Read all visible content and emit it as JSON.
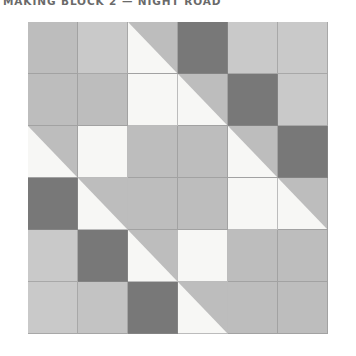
{
  "title": "MAKING BLOCK 2 — NIGHT ROAD",
  "palette": {
    "white": "#f7f7f5",
    "light": "#c9c9c9",
    "medium": "#bdbdbd",
    "medium_light": "#c3c3c3",
    "dark": "#787878",
    "seam": "#8c8c8c",
    "background": "#ffffff",
    "title_color": "#6a6a6a"
  },
  "block": {
    "name": "quilt-block-grid",
    "rows": 6,
    "cols": 6,
    "grid": [
      [
        {
          "name": "patch-r1c1",
          "type": "solid",
          "fill": "medium"
        },
        {
          "name": "patch-r1c2",
          "type": "solid",
          "fill": "light"
        },
        {
          "name": "patch-r1c3",
          "type": "hst",
          "orientation": "tl-br",
          "fill_a": "white",
          "fill_b": "medium"
        },
        {
          "name": "patch-r1c4",
          "type": "solid",
          "fill": "dark"
        },
        {
          "name": "patch-r1c5",
          "type": "solid",
          "fill": "light"
        },
        {
          "name": "patch-r1c6",
          "type": "solid",
          "fill": "light"
        }
      ],
      [
        {
          "name": "patch-r2c1",
          "type": "solid",
          "fill": "medium"
        },
        {
          "name": "patch-r2c2",
          "type": "solid",
          "fill": "medium"
        },
        {
          "name": "patch-r2c3",
          "type": "solid",
          "fill": "white"
        },
        {
          "name": "patch-r2c4",
          "type": "hst",
          "orientation": "tl-br",
          "fill_a": "white",
          "fill_b": "medium"
        },
        {
          "name": "patch-r2c5",
          "type": "solid",
          "fill": "dark"
        },
        {
          "name": "patch-r2c6",
          "type": "solid",
          "fill": "light"
        }
      ],
      [
        {
          "name": "patch-r3c1",
          "type": "hst",
          "orientation": "tl-br",
          "fill_a": "white",
          "fill_b": "medium"
        },
        {
          "name": "patch-r3c2",
          "type": "solid",
          "fill": "white"
        },
        {
          "name": "patch-r3c3",
          "type": "solid",
          "fill": "medium"
        },
        {
          "name": "patch-r3c4",
          "type": "solid",
          "fill": "medium"
        },
        {
          "name": "patch-r3c5",
          "type": "hst",
          "orientation": "tl-br",
          "fill_a": "white",
          "fill_b": "medium"
        },
        {
          "name": "patch-r3c6",
          "type": "solid",
          "fill": "dark"
        }
      ],
      [
        {
          "name": "patch-r4c1",
          "type": "solid",
          "fill": "dark"
        },
        {
          "name": "patch-r4c2",
          "type": "hst",
          "orientation": "bl-tr",
          "fill_a": "medium",
          "fill_b": "white"
        },
        {
          "name": "patch-r4c3",
          "type": "solid",
          "fill": "medium"
        },
        {
          "name": "patch-r4c4",
          "type": "solid",
          "fill": "medium"
        },
        {
          "name": "patch-r4c5",
          "type": "solid",
          "fill": "white"
        },
        {
          "name": "patch-r4c6",
          "type": "hst",
          "orientation": "tl-br",
          "fill_a": "white",
          "fill_b": "medium"
        }
      ],
      [
        {
          "name": "patch-r5c1",
          "type": "solid",
          "fill": "light"
        },
        {
          "name": "patch-r5c2",
          "type": "solid",
          "fill": "dark"
        },
        {
          "name": "patch-r5c3",
          "type": "hst",
          "orientation": "bl-tr",
          "fill_a": "medium",
          "fill_b": "white"
        },
        {
          "name": "patch-r5c4",
          "type": "solid",
          "fill": "white"
        },
        {
          "name": "patch-r5c5",
          "type": "solid",
          "fill": "medium"
        },
        {
          "name": "patch-r5c6",
          "type": "solid",
          "fill": "medium"
        }
      ],
      [
        {
          "name": "patch-r6c1",
          "type": "solid",
          "fill": "light"
        },
        {
          "name": "patch-r6c2",
          "type": "solid",
          "fill": "medium_light"
        },
        {
          "name": "patch-r6c3",
          "type": "solid",
          "fill": "dark"
        },
        {
          "name": "patch-r6c4",
          "type": "hst",
          "orientation": "bl-tr",
          "fill_a": "medium",
          "fill_b": "white"
        },
        {
          "name": "patch-r6c5",
          "type": "solid",
          "fill": "medium"
        },
        {
          "name": "patch-r6c6",
          "type": "solid",
          "fill": "medium"
        }
      ]
    ]
  }
}
